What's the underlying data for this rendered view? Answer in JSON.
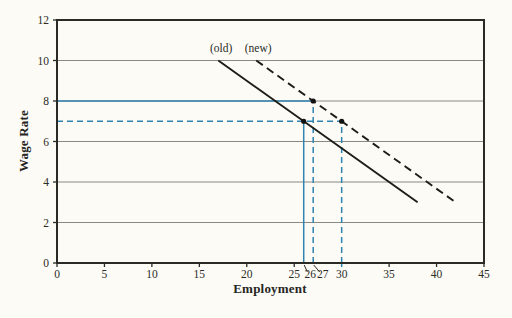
{
  "page": {
    "background": "#fcfbf6"
  },
  "chart_data": {
    "type": "line",
    "title": "",
    "xlabel": "Employment",
    "ylabel": "Wage Rate",
    "xlim": [
      0,
      45
    ],
    "ylim": [
      0,
      12
    ],
    "xticks": [
      0,
      5,
      10,
      15,
      20,
      25,
      35,
      40,
      45
    ],
    "yticks": [
      0,
      2,
      4,
      6,
      8,
      10,
      12
    ],
    "grid_yticks": [
      2,
      4,
      6,
      8,
      10
    ],
    "grid": true,
    "legend_position": "none",
    "colors": {
      "axis": "#2b2b26",
      "grid": "#8a8a84",
      "series": "#1c1c18",
      "guide": "#2f83b0",
      "text": "#2b2b26",
      "marker": "#111110"
    },
    "series": [
      {
        "name": "(old)",
        "style": "solid",
        "points": [
          [
            17,
            10
          ],
          [
            38,
            3
          ]
        ]
      },
      {
        "name": "(new)",
        "style": "dashed",
        "points": [
          [
            21,
            10
          ],
          [
            42,
            3
          ]
        ]
      }
    ],
    "annotations": [
      {
        "text": "(old)",
        "x": 17.3,
        "y": 10.42
      },
      {
        "text": "(new)",
        "x": 21.2,
        "y": 10.42
      }
    ],
    "guides": [
      {
        "orient": "h",
        "at": 8,
        "from": 0,
        "to": 27,
        "style": "solid"
      },
      {
        "orient": "h",
        "at": 7,
        "from": 0,
        "to": 30,
        "style": "dashed"
      },
      {
        "orient": "v",
        "at": 26,
        "from": 0,
        "to": 7,
        "style": "solid"
      },
      {
        "orient": "v",
        "at": 27,
        "from": 0,
        "to": 8,
        "style": "dashed"
      },
      {
        "orient": "v",
        "at": 30,
        "from": 0,
        "to": 7,
        "style": "dashed",
        "tick_below": true
      }
    ],
    "markers": [
      [
        26,
        7
      ],
      [
        27,
        8
      ],
      [
        30,
        7
      ]
    ],
    "special_xlabels": [
      {
        "label": "26",
        "x": 26,
        "label_x": 26.7,
        "leader": true
      },
      {
        "label": "27",
        "x": 27,
        "label_x": 28.0,
        "leader": true
      },
      {
        "label": "30",
        "x": 30,
        "label_x": 30.0,
        "leader": false
      }
    ]
  }
}
